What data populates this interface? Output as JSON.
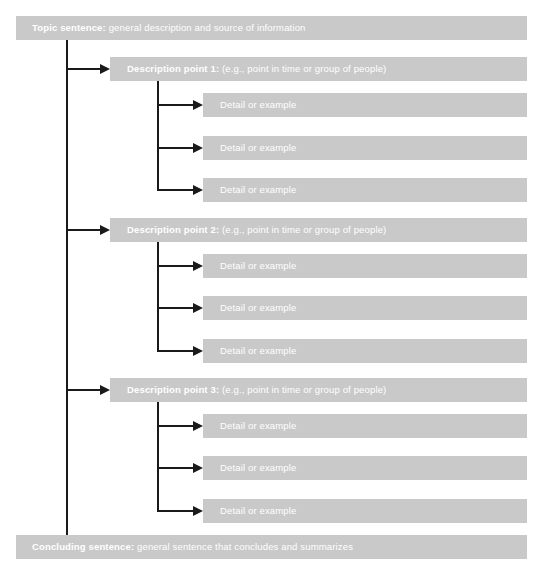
{
  "diagram": {
    "colors": {
      "bar_fill": "#c9c9c9",
      "bar_text": "#ffffff",
      "connector": "#1a1a1a",
      "background": "#ffffff"
    },
    "topic": {
      "lead": "Topic sentence:",
      "rest": " general description and source of information"
    },
    "conclusion": {
      "lead": "Concluding sentence:",
      "rest": " general sentence that concludes and summarizes"
    },
    "points": [
      {
        "lead": "Description point 1:",
        "rest": " (e.g., point in time or group of people)",
        "details": [
          {
            "label": "Detail or example"
          },
          {
            "label": "Detail or example"
          },
          {
            "label": "Detail or example"
          }
        ]
      },
      {
        "lead": "Description point 2:",
        "rest": " (e.g., point in time or group of people)",
        "details": [
          {
            "label": "Detail or example"
          },
          {
            "label": "Detail or example"
          },
          {
            "label": "Detail or example"
          }
        ]
      },
      {
        "lead": "Description point 3:",
        "rest": " (e.g., point in time or group of people)",
        "details": [
          {
            "label": "Detail or example"
          },
          {
            "label": "Detail or example"
          },
          {
            "label": "Detail or example"
          }
        ]
      }
    ]
  }
}
